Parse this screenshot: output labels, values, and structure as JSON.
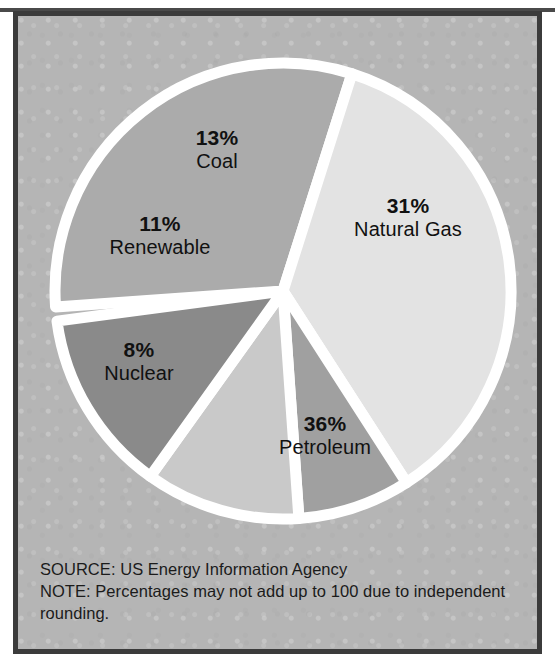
{
  "figure": {
    "background_color": "#b5b5b5",
    "frame_color": "#3b3b3b",
    "separator_color": "#ffffff",
    "text_color": "#111111"
  },
  "footnotes": {
    "source": "SOURCE: US Energy Information Agency",
    "note": "NOTE: Percentages may not add up to 100 due to independent rounding."
  },
  "chart_data": {
    "type": "pie",
    "title": "",
    "subtitle": "",
    "xlabel": "",
    "ylabel": "",
    "units": "percent",
    "total": 99,
    "legend_position": "none",
    "labels_inside_slices": true,
    "start_angle_deg": -94,
    "direction": "clockwise",
    "grid": false,
    "categories": [
      "Natural Gas",
      "Petroleum",
      "Nuclear",
      "Renewable",
      "Coal"
    ],
    "values": [
      31,
      36,
      8,
      11,
      13
    ],
    "slices": [
      {
        "name": "Natural Gas",
        "value": 31,
        "value_label": "31%",
        "color": "#ababab",
        "start_angle_deg": -94,
        "end_angle_deg": 17.6,
        "label_x": 390,
        "label_y": 200
      },
      {
        "name": "Petroleum",
        "value": 36,
        "value_label": "36%",
        "color": "#e3e3e3",
        "start_angle_deg": 17.6,
        "end_angle_deg": 147.2,
        "label_x": 307,
        "label_y": 418
      },
      {
        "name": "Nuclear",
        "value": 8,
        "value_label": "8%",
        "color": "#a0a0a0",
        "start_angle_deg": 147.2,
        "end_angle_deg": 176.0,
        "label_x": 121,
        "label_y": 344
      },
      {
        "name": "Renewable",
        "value": 11,
        "value_label": "11%",
        "color": "#c9c9c9",
        "start_angle_deg": 176.0,
        "end_angle_deg": 215.6,
        "label_x": 142,
        "label_y": 218
      },
      {
        "name": "Coal",
        "value": 13,
        "value_label": "13%",
        "color": "#8a8a8a",
        "start_angle_deg": 215.6,
        "end_angle_deg": 262.4,
        "label_x": 199,
        "label_y": 132
      }
    ],
    "annotations": [
      "SOURCE: US Energy Information Agency",
      "NOTE: Percentages may not add up to 100 due to independent rounding."
    ]
  }
}
